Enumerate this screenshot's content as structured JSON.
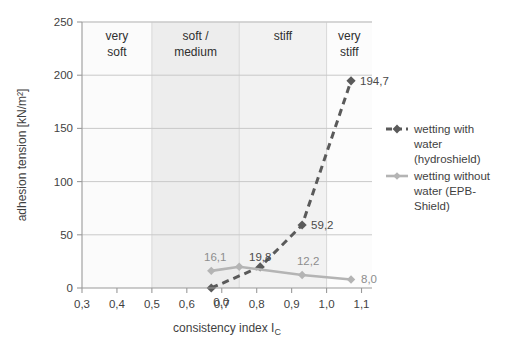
{
  "chart_data": {
    "type": "line",
    "title": "",
    "xlabel": "consistency index I_C",
    "xlabel_main": "consistency index I",
    "xlabel_sub": "C",
    "ylabel": "adhesion tension [kN/m²]",
    "xlim": [
      0.3,
      1.13
    ],
    "ylim": [
      0,
      250
    ],
    "xticks": [
      0.3,
      0.4,
      0.5,
      0.6,
      0.7,
      0.8,
      0.9,
      1.0,
      1.1
    ],
    "xticklabels": [
      "0,3",
      "0,4",
      "0,5",
      "0,6",
      "0,7",
      "0,8",
      "0,9",
      "1,0",
      "1,1"
    ],
    "yticks": [
      0,
      50,
      100,
      150,
      200,
      250
    ],
    "yticklabels": [
      "0",
      "50",
      "100",
      "150",
      "200",
      "250"
    ],
    "grid": "horizontal",
    "legend_position": "right",
    "series": [
      {
        "name": "wetting with water (hydroshield)",
        "legend_lines": [
          "wetting with",
          "water",
          "(hydroshield)"
        ],
        "color": "#5a5a5a",
        "style": "dashed",
        "marker": "diamond",
        "x": [
          0.67,
          0.81,
          0.93,
          1.07
        ],
        "y": [
          0.0,
          19.8,
          59.2,
          194.7
        ],
        "labels": [
          "0,0",
          "19,8",
          "59,2",
          "194,7"
        ]
      },
      {
        "name": "wetting without water (EPB-Shield)",
        "legend_lines": [
          "wetting without",
          "water (EPB-",
          "Shield)"
        ],
        "color": "#b4b4b4",
        "style": "solid",
        "marker": "diamond",
        "x": [
          0.67,
          0.75,
          0.93,
          1.07
        ],
        "y": [
          16.1,
          20.0,
          12.2,
          8.0
        ],
        "labels": [
          "16,1",
          "",
          "12,2",
          "8,0"
        ]
      }
    ],
    "bands": [
      {
        "label": "very soft",
        "lines": [
          "very",
          "soft"
        ],
        "x0": 0.3,
        "x1": 0.5,
        "fill": "#fbfbfb"
      },
      {
        "label": "soft / medium",
        "lines": [
          "soft /",
          "medium"
        ],
        "x0": 0.5,
        "x1": 0.75,
        "fill": "#ededed"
      },
      {
        "label": "stiff",
        "lines": [
          "stiff"
        ],
        "x0": 0.75,
        "x1": 1.0,
        "fill": "#f2f2f2"
      },
      {
        "label": "very stiff",
        "lines": [
          "very",
          "stiff"
        ],
        "x0": 1.0,
        "x1": 1.13,
        "fill": "#fcfcfc"
      }
    ]
  }
}
